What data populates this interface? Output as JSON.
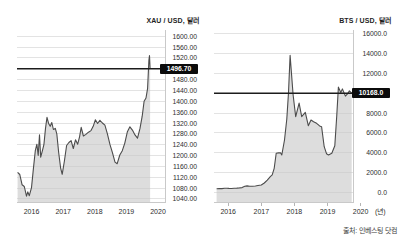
{
  "page": {
    "background": "#ffffff",
    "source_note": "출처: 인베스팅 닷컴"
  },
  "colors": {
    "area_fill": "#c8c8c8",
    "series_line": "#4c4c4c",
    "gridline": "#e3e3e3",
    "axis_line": "#c9c9c9",
    "tick_mark": "#b5b5b5",
    "current_value_line": "#1c1c1c",
    "badge_background": "#0b0b0b",
    "badge_text": "#ffffff",
    "label_text": "#2e2e2e"
  },
  "chart_data": [
    {
      "type": "area",
      "title": "XAU / USD, 달러",
      "unit": "달러",
      "current_value": 1496.7,
      "current_label": "1496.70",
      "legend": "none",
      "grid": true,
      "xlim": [
        2015.54,
        2020.22
      ],
      "ylim": [
        1040,
        1600
      ],
      "x_ticks": [
        {
          "v": 2016,
          "label": "2016"
        },
        {
          "v": 2017,
          "label": "2017"
        },
        {
          "v": 2018,
          "label": "2018"
        },
        {
          "v": 2019,
          "label": "2019"
        },
        {
          "v": 2020,
          "label": "2020"
        }
      ],
      "y_slots": [
        {
          "v": 1600,
          "label": "1600.00"
        },
        {
          "v": 1560,
          "label": "1560.00"
        },
        {
          "v": 1520,
          "label": "1520.00"
        },
        {
          "v": 1496.7,
          "label": "1496.70",
          "badge": true
        },
        {
          "v": 1480,
          "label": "1480.00"
        },
        {
          "v": 1440,
          "label": "1440.00"
        },
        {
          "v": 1400,
          "label": "1400.00"
        },
        {
          "v": 1360,
          "label": "1360.00"
        },
        {
          "v": 1320,
          "label": "1320.00"
        },
        {
          "v": 1280,
          "label": "1280.00"
        },
        {
          "v": 1240,
          "label": "1240.00"
        },
        {
          "v": 1200,
          "label": "1200.00"
        },
        {
          "v": 1160,
          "label": "1160.00"
        },
        {
          "v": 1120,
          "label": "1120.00"
        },
        {
          "v": 1080,
          "label": "1080.00"
        },
        {
          "v": 1040,
          "label": "1040.00"
        }
      ],
      "points": [
        [
          2015.56,
          1138
        ],
        [
          2015.63,
          1130
        ],
        [
          2015.7,
          1092
        ],
        [
          2015.77,
          1086
        ],
        [
          2015.84,
          1050
        ],
        [
          2015.88,
          1066
        ],
        [
          2015.93,
          1052
        ],
        [
          2016.0,
          1082
        ],
        [
          2016.06,
          1152
        ],
        [
          2016.12,
          1218
        ],
        [
          2016.17,
          1242
        ],
        [
          2016.21,
          1200
        ],
        [
          2016.25,
          1277
        ],
        [
          2016.29,
          1194
        ],
        [
          2016.34,
          1216
        ],
        [
          2016.39,
          1240
        ],
        [
          2016.44,
          1300
        ],
        [
          2016.49,
          1341
        ],
        [
          2016.54,
          1318
        ],
        [
          2016.59,
          1308
        ],
        [
          2016.64,
          1322
        ],
        [
          2016.69,
          1296
        ],
        [
          2016.75,
          1300
        ],
        [
          2016.8,
          1280
        ],
        [
          2016.86,
          1210
        ],
        [
          2016.92,
          1155
        ],
        [
          2016.97,
          1131
        ],
        [
          2017.04,
          1180
        ],
        [
          2017.11,
          1237
        ],
        [
          2017.18,
          1248
        ],
        [
          2017.25,
          1255
        ],
        [
          2017.32,
          1226
        ],
        [
          2017.39,
          1258
        ],
        [
          2017.46,
          1242
        ],
        [
          2017.52,
          1270
        ],
        [
          2017.57,
          1304
        ],
        [
          2017.64,
          1272
        ],
        [
          2017.72,
          1278
        ],
        [
          2017.8,
          1286
        ],
        [
          2017.88,
          1292
        ],
        [
          2017.95,
          1308
        ],
        [
          2018.02,
          1332
        ],
        [
          2018.09,
          1318
        ],
        [
          2018.16,
          1330
        ],
        [
          2018.24,
          1320
        ],
        [
          2018.32,
          1312
        ],
        [
          2018.4,
          1280
        ],
        [
          2018.48,
          1240
        ],
        [
          2018.56,
          1210
        ],
        [
          2018.64,
          1176
        ],
        [
          2018.71,
          1170
        ],
        [
          2018.79,
          1202
        ],
        [
          2018.87,
          1218
        ],
        [
          2018.95,
          1246
        ],
        [
          2019.03,
          1288
        ],
        [
          2019.11,
          1306
        ],
        [
          2019.19,
          1294
        ],
        [
          2019.27,
          1276
        ],
        [
          2019.35,
          1264
        ],
        [
          2019.43,
          1300
        ],
        [
          2019.5,
          1345
        ],
        [
          2019.56,
          1400
        ],
        [
          2019.62,
          1412
        ],
        [
          2019.67,
          1448
        ],
        [
          2019.71,
          1515
        ],
        [
          2019.73,
          1529
        ],
        [
          2019.75,
          1496.7
        ]
      ]
    },
    {
      "type": "area",
      "title": "BTS / USD, 달러",
      "unit": "달러",
      "current_value": 10168.0,
      "current_label": "10168.0",
      "x_axis_suffix": "(년)",
      "legend": "none",
      "grid": true,
      "xlim": [
        2015.57,
        2019.77
      ],
      "ylim": [
        0,
        16000
      ],
      "x_ticks": [
        {
          "v": 2016,
          "label": "2016"
        },
        {
          "v": 2017,
          "label": "2017"
        },
        {
          "v": 2018,
          "label": "2018"
        },
        {
          "v": 2019,
          "label": "2019"
        },
        {
          "v": 2020,
          "label": "2020"
        }
      ],
      "y_slots": [
        {
          "v": 16000,
          "label": "16000.0"
        },
        {
          "v": 14000,
          "label": "14000.0"
        },
        {
          "v": 12000,
          "label": "12000.0"
        },
        {
          "v": 10168,
          "label": "10168.0",
          "badge": true
        },
        {
          "v": 8000,
          "label": "8000.0"
        },
        {
          "v": 6000,
          "label": "6000.0"
        },
        {
          "v": 4000,
          "label": "4000.0"
        },
        {
          "v": 2000,
          "label": "2000.0"
        },
        {
          "v": 0,
          "label": "0.0"
        }
      ],
      "points": [
        [
          2015.65,
          372
        ],
        [
          2015.73,
          392
        ],
        [
          2015.81,
          382
        ],
        [
          2015.89,
          415
        ],
        [
          2015.96,
          428
        ],
        [
          2016.02,
          405
        ],
        [
          2016.1,
          395
        ],
        [
          2016.18,
          420
        ],
        [
          2016.26,
          436
        ],
        [
          2016.34,
          450
        ],
        [
          2016.42,
          482
        ],
        [
          2016.5,
          612
        ],
        [
          2016.57,
          655
        ],
        [
          2016.65,
          620
        ],
        [
          2016.73,
          614
        ],
        [
          2016.82,
          645
        ],
        [
          2016.9,
          700
        ],
        [
          2017.0,
          750
        ],
        [
          2017.09,
          950
        ],
        [
          2017.18,
          1230
        ],
        [
          2017.27,
          1580
        ],
        [
          2017.33,
          1760
        ],
        [
          2017.39,
          2430
        ],
        [
          2017.45,
          3950
        ],
        [
          2017.52,
          3980
        ],
        [
          2017.58,
          4000
        ],
        [
          2017.62,
          3770
        ],
        [
          2017.7,
          5280
        ],
        [
          2017.77,
          7400
        ],
        [
          2017.82,
          10200
        ],
        [
          2017.87,
          13800
        ],
        [
          2017.96,
          9990
        ],
        [
          2018.04,
          7630
        ],
        [
          2018.14,
          9080
        ],
        [
          2018.22,
          7630
        ],
        [
          2018.33,
          8070
        ],
        [
          2018.42,
          6720
        ],
        [
          2018.5,
          7290
        ],
        [
          2018.58,
          7120
        ],
        [
          2018.67,
          6960
        ],
        [
          2018.76,
          6700
        ],
        [
          2018.82,
          6620
        ],
        [
          2018.9,
          4600
        ],
        [
          2018.97,
          3900
        ],
        [
          2019.03,
          3770
        ],
        [
          2019.13,
          3950
        ],
        [
          2019.22,
          4700
        ],
        [
          2019.28,
          7800
        ],
        [
          2019.33,
          10730
        ],
        [
          2019.4,
          10230
        ],
        [
          2019.45,
          10560
        ],
        [
          2019.54,
          9850
        ],
        [
          2019.61,
          10120
        ],
        [
          2019.66,
          10380
        ],
        [
          2019.73,
          10168
        ]
      ]
    }
  ]
}
